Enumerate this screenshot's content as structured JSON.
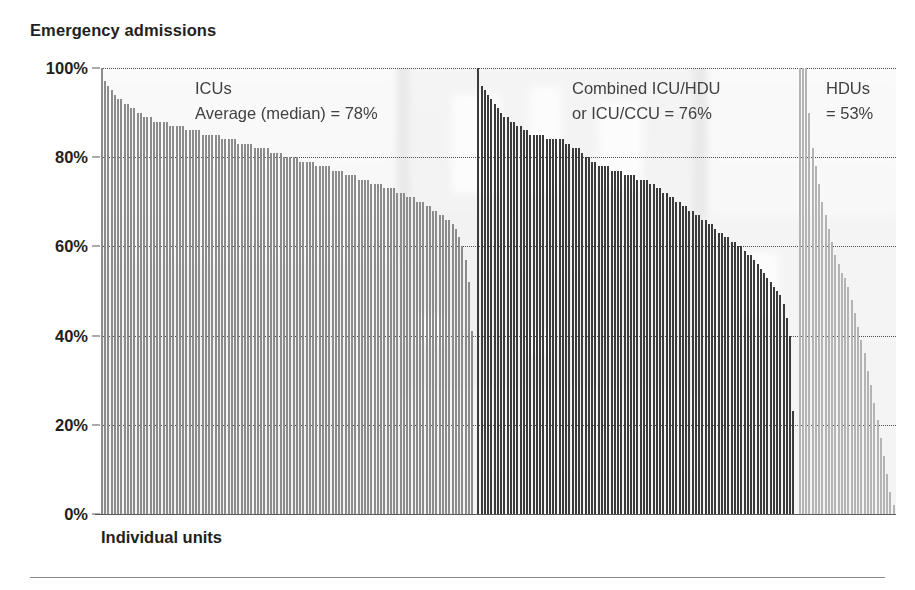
{
  "chart_title": "Emergency admissions",
  "xlabel": "Individual units",
  "annotations": {
    "icus_line1": "ICUs",
    "icus_line2": "Average (median) = 78%",
    "combined_line1": "Combined ICU/HDU",
    "combined_line2": "or ICU/CCU = 76%",
    "hdus_line1": "HDUs",
    "hdus_line2": "= 53%"
  },
  "colors": {
    "icu_bar": "#8c8c8c",
    "combined_bar": "#3b3b3b",
    "hdu_bar": "#b4b4b4",
    "axis": "#58595b",
    "gridline": "#4d4d4d",
    "title_text": "#231f20",
    "annotation_text": "#414042",
    "background": "#ffffff"
  },
  "chart_data": {
    "type": "bar",
    "title": "Emergency admissions",
    "xlabel": "Individual units",
    "ylabel": "",
    "ylim": [
      0,
      100
    ],
    "yticks": [
      0,
      20,
      40,
      60,
      80,
      100
    ],
    "ytick_labels": [
      "0%",
      "20%",
      "40%",
      "60%",
      "80%",
      "100%"
    ],
    "grid": true,
    "legend": "none",
    "series": [
      {
        "name": "ICUs",
        "color": "#8c8c8c",
        "median": 78,
        "median_label": "Average (median) = 78%",
        "count": 115,
        "values": [
          100,
          97,
          96,
          95,
          94,
          93,
          93,
          92,
          92,
          91,
          91,
          90,
          90,
          89,
          89,
          89,
          88,
          88,
          88,
          88,
          88,
          87,
          87,
          87,
          87,
          87,
          86,
          86,
          86,
          86,
          86,
          85,
          85,
          85,
          85,
          85,
          85,
          84,
          84,
          84,
          84,
          84,
          83,
          83,
          83,
          83,
          83,
          82,
          82,
          82,
          82,
          82,
          81,
          81,
          81,
          81,
          80,
          80,
          80,
          80,
          80,
          79,
          79,
          79,
          79,
          79,
          78,
          78,
          78,
          78,
          78,
          77,
          77,
          77,
          77,
          76,
          76,
          76,
          76,
          75,
          75,
          75,
          75,
          74,
          74,
          74,
          74,
          73,
          73,
          73,
          73,
          72,
          72,
          72,
          71,
          71,
          71,
          70,
          70,
          70,
          69,
          69,
          68,
          68,
          67,
          67,
          66,
          66,
          65,
          64,
          62,
          60,
          57,
          52,
          41
        ]
      },
      {
        "name": "Combined ICU/HDU or ICU/CCU",
        "color": "#3b3b3b",
        "median": 76,
        "median_label": "Combined ICU/HDU or ICU/CCU = 76%",
        "count": 98,
        "values": [
          100,
          96,
          95,
          94,
          93,
          92,
          91,
          90,
          89,
          89,
          88,
          88,
          87,
          87,
          86,
          86,
          85,
          85,
          85,
          85,
          85,
          84,
          84,
          84,
          84,
          84,
          84,
          83,
          83,
          82,
          82,
          82,
          81,
          80,
          80,
          79,
          79,
          78,
          78,
          78,
          78,
          77,
          77,
          77,
          77,
          76,
          76,
          76,
          76,
          75,
          75,
          75,
          75,
          74,
          74,
          73,
          73,
          72,
          72,
          71,
          71,
          70,
          70,
          69,
          69,
          68,
          68,
          67,
          67,
          66,
          66,
          65,
          65,
          64,
          63,
          63,
          62,
          62,
          61,
          61,
          60,
          60,
          59,
          58,
          58,
          57,
          56,
          55,
          54,
          53,
          52,
          51,
          50,
          49,
          47,
          44,
          40,
          23
        ]
      },
      {
        "name": "HDUs",
        "color": "#b4b4b4",
        "median": 53,
        "median_label": "= 53%",
        "count": 30,
        "values": [
          100,
          100,
          100,
          90,
          82,
          78,
          74,
          70,
          67,
          64,
          61,
          58,
          56,
          54,
          53,
          51,
          48,
          45,
          42,
          39,
          36,
          32,
          29,
          25,
          21,
          17,
          13,
          9,
          5,
          2
        ]
      }
    ]
  }
}
